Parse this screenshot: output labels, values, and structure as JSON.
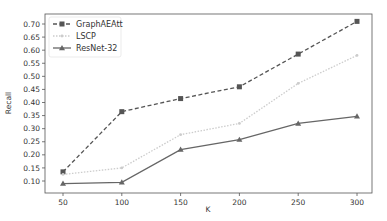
{
  "chart_data": {
    "type": "line",
    "title": "",
    "xlabel": "K",
    "ylabel": "Recall",
    "x": [
      50,
      100,
      150,
      200,
      250,
      300
    ],
    "xticks": [
      "50",
      "100",
      "150",
      "200",
      "250",
      "300"
    ],
    "yticks": [
      "0.10",
      "0.15",
      "0.20",
      "0.25",
      "0.30",
      "0.35",
      "0.40",
      "0.45",
      "0.50",
      "0.55",
      "0.60",
      "0.65",
      "0.70"
    ],
    "xlim": [
      43,
      307
    ],
    "ylim": [
      0.075,
      0.73
    ],
    "grid": false,
    "legend_position": "upper left",
    "series": [
      {
        "name": "GraphAEAtt",
        "values": [
          0.135,
          0.365,
          0.415,
          0.46,
          0.585,
          0.71
        ],
        "color": "#555555",
        "linestyle": "dashed",
        "marker": "square"
      },
      {
        "name": "LSCP",
        "values": [
          0.125,
          0.15,
          0.277,
          0.32,
          0.473,
          0.58
        ],
        "color": "#cccccc",
        "linestyle": "dotted",
        "marker": "dot"
      },
      {
        "name": "ResNet-32",
        "values": [
          0.09,
          0.095,
          0.22,
          0.258,
          0.32,
          0.347
        ],
        "color": "#666666",
        "linestyle": "solid",
        "marker": "triangle"
      }
    ]
  }
}
